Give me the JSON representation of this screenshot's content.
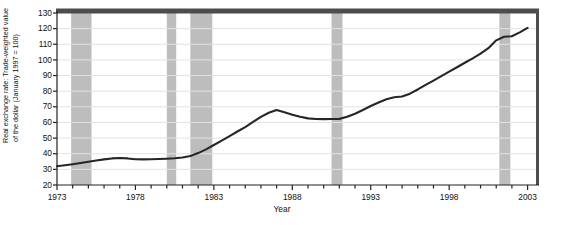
{
  "chart_data": {
    "type": "line",
    "title": "",
    "xlabel": "Year",
    "ylabel": "Real exchange rate: Trade-weighted value of the dollar (January 1997 = 100)",
    "ylabel_lines": [
      "Real exchange rate: Trade-weighted value",
      "of the dollar (January 1997 = 100)"
    ],
    "xlim": [
      1973,
      2003.6
    ],
    "ylim": [
      20,
      130
    ],
    "yticks": [
      20,
      30,
      40,
      50,
      60,
      70,
      80,
      90,
      100,
      110,
      120,
      130
    ],
    "ytick_labels": [
      "20",
      "30",
      "40",
      "50",
      "60",
      "70",
      "80",
      "90",
      "100",
      "110",
      "120",
      "130"
    ],
    "xticks": [
      1973,
      1974,
      1975,
      1976,
      1977,
      1978,
      1979,
      1980,
      1981,
      1982,
      1983,
      1984,
      1985,
      1986,
      1987,
      1988,
      1989,
      1990,
      1991,
      1992,
      1993,
      1994,
      1995,
      1996,
      1997,
      1998,
      1999,
      2000,
      2001,
      2002,
      2003
    ],
    "xtick_labels_major": [
      "1973",
      "1978",
      "1983",
      "1988",
      "1993",
      "1998",
      "2003"
    ],
    "xticks_major": [
      1973,
      1978,
      1983,
      1988,
      1993,
      1998,
      2003
    ],
    "grid": "horizontal",
    "legend": "none",
    "line_color": "#262626",
    "line_width": 2.1,
    "recession_band_color": "#bdbdbd",
    "plot_border_color": "#4d4d4d",
    "grid_color": "#e2e2e2",
    "background": "#ffffff",
    "series": [
      {
        "name": "Real exchange rate (trade-weighted dollar)",
        "x": [
          1973.0,
          1973.5,
          1974.0,
          1974.5,
          1975.0,
          1975.5,
          1976.0,
          1976.5,
          1977.0,
          1977.5,
          1978.0,
          1978.5,
          1979.0,
          1979.5,
          1980.0,
          1980.5,
          1981.0,
          1981.5,
          1982.0,
          1982.5,
          1983.0,
          1983.5,
          1984.0,
          1984.5,
          1985.0,
          1985.5,
          1986.0,
          1986.5,
          1987.0,
          1987.5,
          1988.0,
          1988.5,
          1989.0,
          1989.5,
          1990.0,
          1990.5,
          1991.0,
          1991.5,
          1992.0,
          1992.5,
          1993.0,
          1993.5,
          1994.0,
          1994.5,
          1995.0,
          1995.5,
          1996.0,
          1996.5,
          1997.0,
          1997.5,
          1998.0,
          1998.5,
          1999.0,
          1999.5,
          2000.0,
          2000.5,
          2001.0,
          2001.5,
          2002.0,
          2002.5,
          2003.0
        ],
        "y": [
          32.0,
          32.6,
          33.3,
          34.1,
          34.9,
          35.7,
          36.4,
          37.0,
          37.3,
          37.0,
          36.5,
          36.4,
          36.5,
          36.6,
          36.8,
          37.1,
          37.6,
          38.6,
          40.4,
          42.8,
          45.6,
          48.4,
          51.3,
          54.2,
          57.0,
          60.3,
          63.6,
          66.2,
          67.9,
          66.5,
          65.0,
          63.6,
          62.6,
          62.2,
          62.1,
          62.2,
          62.3,
          63.6,
          65.6,
          68.0,
          70.5,
          72.8,
          74.9,
          76.1,
          76.6,
          78.4,
          81.1,
          84.0,
          86.8,
          89.6,
          92.5,
          95.3,
          98.2,
          101.0,
          104.0,
          107.5,
          112.5,
          114.8,
          115.1,
          117.6,
          120.5
        ],
        "y_at_major_years": {
          "1973": 32.0,
          "1978": 36.5,
          "1983": 45.6,
          "1988": 65.0,
          "1993": 70.5,
          "1998": 92.5,
          "2003": 120.5
        },
        "peak_1985": 68.0,
        "trough_1990": 62.1,
        "peak_2002": 129.5,
        "end_value": 120.0
      }
    ],
    "shaded_regions": {
      "label": "recession bands",
      "bands": [
        {
          "start": 1973.9,
          "end": 1975.2
        },
        {
          "start": 1980.0,
          "end": 1980.6
        },
        {
          "start": 1981.5,
          "end": 1982.9
        },
        {
          "start": 1990.5,
          "end": 1991.2
        },
        {
          "start": 2001.2,
          "end": 2001.9
        }
      ]
    }
  }
}
